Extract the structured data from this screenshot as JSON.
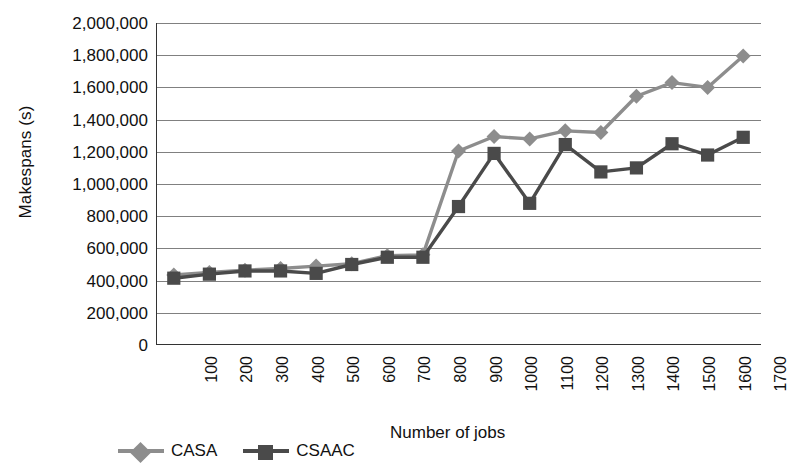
{
  "chart_data": {
    "type": "line",
    "title": "",
    "xlabel": "Number of jobs",
    "ylabel": "Makespans (s)",
    "categories": [
      100,
      200,
      300,
      400,
      500,
      600,
      700,
      800,
      900,
      1000,
      1100,
      1200,
      1300,
      1400,
      1500,
      1600,
      1700
    ],
    "x_tick_labels": [
      "100",
      "200",
      "300",
      "400",
      "500",
      "600",
      "700",
      "800",
      "900",
      "1000",
      "1100",
      "1200",
      "1300",
      "1400",
      "1500",
      "1600",
      "1700"
    ],
    "y_tick_labels": [
      "2,000,000",
      "1,800,000",
      "1,600,000",
      "1,400,000",
      "1,200,000",
      "1,000,000",
      "800,000",
      "600,000",
      "400,000",
      "200,000",
      "0"
    ],
    "y_tick_values": [
      2000000,
      1800000,
      1600000,
      1400000,
      1200000,
      1000000,
      800000,
      600000,
      400000,
      200000,
      0
    ],
    "ylim": [
      0,
      2000000
    ],
    "y_major_step": 200000,
    "grid": "horizontal",
    "legend_position": "bottom-left",
    "series": [
      {
        "name": "CASA",
        "marker": "diamond",
        "color": "#8d8d8d",
        "values": [
          435000,
          450000,
          465000,
          475000,
          490000,
          505000,
          555000,
          560000,
          1205000,
          1295000,
          1280000,
          1330000,
          1320000,
          1545000,
          1630000,
          1600000,
          1795000
        ]
      },
      {
        "name": "CSAAC",
        "marker": "square",
        "color": "#4a4a4a",
        "values": [
          415000,
          440000,
          460000,
          460000,
          445000,
          500000,
          545000,
          545000,
          860000,
          1190000,
          880000,
          1245000,
          1075000,
          1100000,
          1250000,
          1180000,
          1290000
        ]
      }
    ]
  },
  "legend": {
    "entries": [
      {
        "label": "CASA"
      },
      {
        "label": "CSAAC"
      }
    ]
  },
  "colors": {
    "series_casa": "#8d8d8d",
    "series_csaac": "#4a4a4a",
    "gridline": "#808080",
    "axis": "#333333",
    "text": "#111111",
    "background": "#ffffff"
  }
}
